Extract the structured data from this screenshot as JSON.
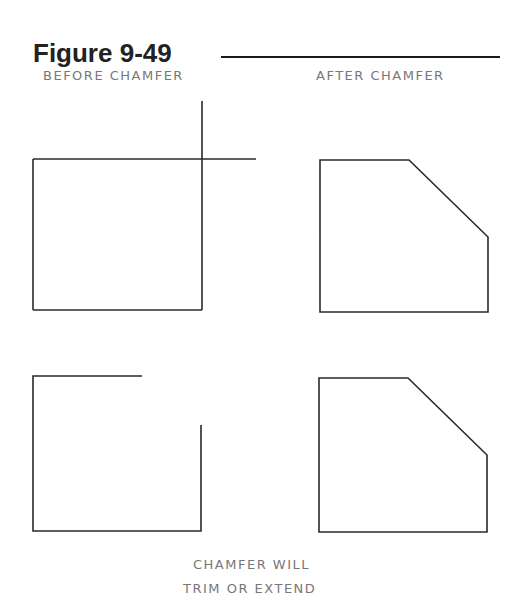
{
  "figure": {
    "title": "Figure 9-49"
  },
  "labels": {
    "before": "BEFORE CHAMFER",
    "after": "AFTER CHAMFER",
    "note_line1": "CHAMFER WILL",
    "note_line2": "TRIM OR EXTEND"
  },
  "colors": {
    "line": "#2a2a2a",
    "label_text": "#777777",
    "title_text": "#222222"
  }
}
